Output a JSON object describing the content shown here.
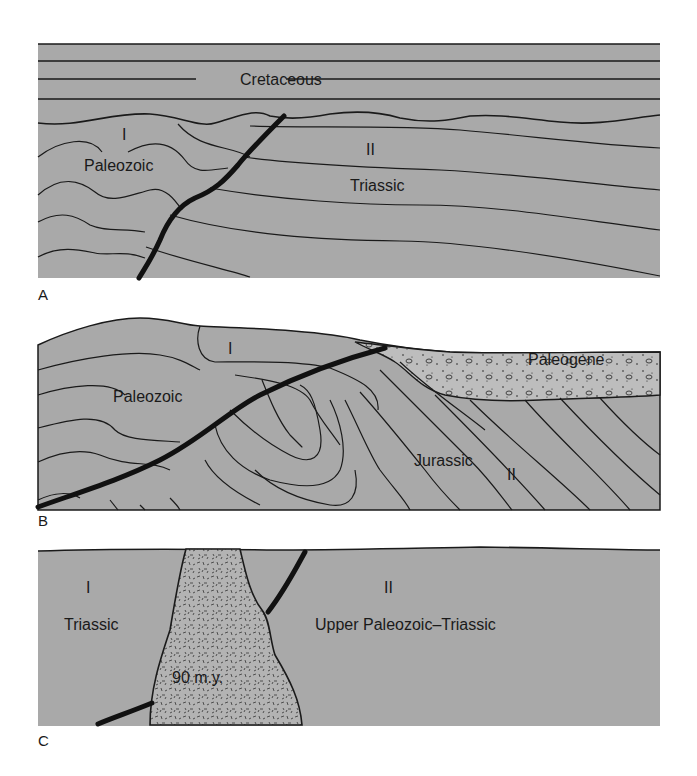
{
  "colors": {
    "rock_fill": "#a9a9a9",
    "line": "#1a1a1a",
    "granite_fill": "#b3b3b3",
    "conglomerate_fill": "#bdbdbd"
  },
  "panels": [
    {
      "id": "A",
      "label": "A",
      "units": {
        "cretaceous": "Cretaceous",
        "block_1_numeral": "I",
        "block_1_rock": "Paleozoic",
        "block_2_numeral": "II",
        "block_2_rock": "Triassic"
      }
    },
    {
      "id": "B",
      "label": "B",
      "units": {
        "block_1_numeral": "I",
        "block_1_rock": "Paleozoic",
        "cover": "Paleogene",
        "block_2_rock": "Jurassic",
        "block_2_numeral": "II"
      }
    },
    {
      "id": "C",
      "label": "C",
      "units": {
        "block_1_numeral": "I",
        "block_1_rock": "Triassic",
        "pluton_age": "90 m.y.",
        "block_2_numeral": "II",
        "block_2_rock": "Upper Paleozoic–Triassic"
      }
    }
  ]
}
